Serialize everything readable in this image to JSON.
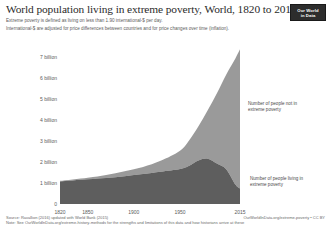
{
  "header": {
    "title": "World population living in extreme poverty, World, 1820 to 2015",
    "subtitle_line1": "Extreme poverty is defined as living on less than 1.90 international-$ per day.",
    "subtitle_line2": "International-$ are adjusted for price differences between countries and for price changes over time (inflation).",
    "logo_line1": "Our World",
    "logo_line2": "in Data"
  },
  "annotations": {
    "upper": "Number of people not in extreme poverty",
    "lower": "Number of people living in extreme poverty"
  },
  "footer": {
    "source": "Source: Ravallion (2016) updated with World Bank (2015)",
    "note": "Note: See OurWorldInData.org/extreme-history-methods for the strengths and limitations of this data and how historians arrive at these",
    "credit": "OurWorldInData.org/extreme-poverty  •  CC BY"
  },
  "colors": {
    "not_in_poverty": "#9a9a9a",
    "in_poverty": "#5e5e5e",
    "text": "#2b2b2b",
    "muted": "#5a5a5a",
    "logo_bg": "#2d2d2d"
  },
  "chart_data": {
    "type": "area",
    "stacked": true,
    "title": "World population living in extreme poverty, World, 1820 to 2015",
    "xlabel": "",
    "ylabel": "",
    "xlim": [
      1820,
      2015
    ],
    "ylim": [
      0,
      7.5
    ],
    "grid": false,
    "legend_position": "inline-annotations",
    "y_tick_labels": [
      "0",
      "1 billion",
      "2 billion",
      "3 billion",
      "4 billion",
      "5 billion",
      "6 billion",
      "7 billion"
    ],
    "y_tick_values": [
      0,
      1,
      2,
      3,
      4,
      5,
      6,
      7
    ],
    "x_tick_labels": [
      "1820",
      "1850",
      "1900",
      "1950",
      "2015"
    ],
    "x_tick_values": [
      1820,
      1850,
      1900,
      1950,
      2015
    ],
    "x": [
      1820,
      1850,
      1870,
      1890,
      1910,
      1929,
      1950,
      1960,
      1970,
      1980,
      1990,
      2000,
      2010,
      2015
    ],
    "series": [
      {
        "name": "Number of people living in extreme poverty",
        "color": "#5e5e5e",
        "values": [
          1.07,
          1.17,
          1.23,
          1.32,
          1.42,
          1.53,
          1.66,
          1.82,
          2.07,
          2.15,
          1.92,
          1.65,
          0.92,
          0.73
        ]
      },
      {
        "name": "Number of people not in extreme poverty",
        "color": "#9a9a9a",
        "values": [
          0.03,
          0.08,
          0.15,
          0.23,
          0.34,
          0.52,
          0.87,
          1.21,
          1.62,
          2.3,
          3.34,
          4.49,
          5.99,
          6.61
        ]
      }
    ],
    "total_values": [
      1.1,
      1.25,
      1.38,
      1.55,
      1.76,
      2.05,
      2.53,
      3.03,
      3.69,
      4.45,
      5.26,
      6.14,
      6.91,
      7.34
    ]
  }
}
